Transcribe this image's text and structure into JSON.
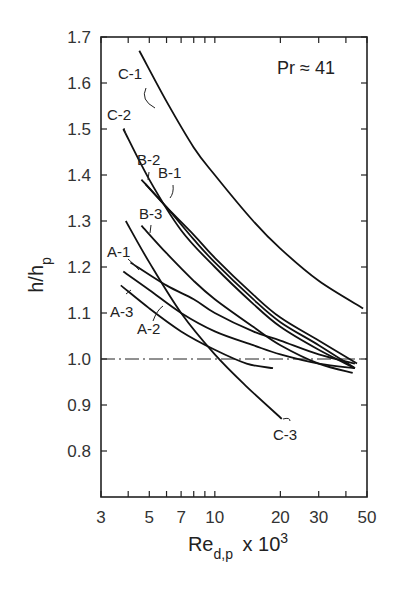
{
  "chart_data": {
    "type": "line",
    "title": "",
    "annotation": "Pr ≈ 41",
    "xlabel": "Re_d,p x 10^3",
    "ylabel": "h/h_p",
    "xscale": "log",
    "xlim": [
      3,
      50
    ],
    "ylim": [
      0.7,
      1.7
    ],
    "xticks": [
      3,
      5,
      7,
      10,
      20,
      30,
      50
    ],
    "xminor": [
      4,
      6,
      8,
      9,
      40
    ],
    "yticks": [
      0.8,
      0.9,
      1.0,
      1.1,
      1.2,
      1.3,
      1.4,
      1.5,
      1.6,
      1.7
    ],
    "reference_line": {
      "y": 1.0,
      "style": "dash-dot"
    },
    "grid": false,
    "series": [
      {
        "name": "C-1",
        "x": [
          4.5,
          6,
          8,
          10,
          15,
          20,
          30,
          48
        ],
        "y": [
          1.67,
          1.56,
          1.46,
          1.4,
          1.3,
          1.24,
          1.17,
          1.11
        ]
      },
      {
        "name": "C-2",
        "x": [
          3.8,
          5,
          7,
          10,
          15,
          20,
          30,
          44
        ],
        "y": [
          1.5,
          1.39,
          1.28,
          1.2,
          1.12,
          1.07,
          1.02,
          0.98
        ]
      },
      {
        "name": "B-2",
        "x": [
          4.6,
          6,
          8,
          10,
          15,
          20,
          30,
          44
        ],
        "y": [
          1.39,
          1.33,
          1.26,
          1.21,
          1.13,
          1.08,
          1.03,
          0.98
        ]
      },
      {
        "name": "B-1",
        "x": [
          4.8,
          6,
          8,
          10,
          15,
          20,
          30,
          45
        ],
        "y": [
          1.38,
          1.33,
          1.27,
          1.22,
          1.14,
          1.09,
          1.04,
          0.99
        ]
      },
      {
        "name": "B-3",
        "x": [
          4.6,
          6,
          8,
          10,
          15,
          20,
          30,
          43
        ],
        "y": [
          1.29,
          1.23,
          1.17,
          1.13,
          1.07,
          1.03,
          0.99,
          0.97
        ]
      },
      {
        "name": "C-3",
        "x": [
          3.9,
          5,
          7,
          10,
          14,
          20.3
        ],
        "y": [
          1.3,
          1.21,
          1.1,
          1.01,
          0.94,
          0.87
        ]
      },
      {
        "name": "A-1",
        "x": [
          4.1,
          6,
          8,
          10,
          15,
          20,
          30,
          44
        ],
        "y": [
          1.21,
          1.16,
          1.13,
          1.1,
          1.06,
          1.04,
          1.01,
          0.99
        ]
      },
      {
        "name": "A-3",
        "x": [
          3.8,
          5,
          7,
          10,
          15,
          20,
          30,
          44
        ],
        "y": [
          1.19,
          1.15,
          1.1,
          1.06,
          1.03,
          1.01,
          0.99,
          0.98
        ]
      },
      {
        "name": "A-2",
        "x": [
          3.7,
          5,
          7,
          10,
          14,
          18.5
        ],
        "y": [
          1.16,
          1.11,
          1.06,
          1.02,
          0.99,
          0.98
        ]
      }
    ],
    "labels": [
      {
        "name": "C-1",
        "x": 118,
        "y": 79,
        "leader": "M146,88 Q140,100 155,108"
      },
      {
        "name": "C-2",
        "x": 107,
        "y": 120,
        "leader": "M124,128 L126,135"
      },
      {
        "name": "B-2",
        "x": 137,
        "y": 165,
        "leader": "M149,172 L148,180"
      },
      {
        "name": "B-1",
        "x": 158,
        "y": 178,
        "leader": "M173,185 Q174,193 170,198"
      },
      {
        "name": "B-3",
        "x": 139,
        "y": 219,
        "leader": "M151,225 L150,233"
      },
      {
        "name": "A-1",
        "x": 107,
        "y": 257,
        "leader": "M128,259 Q135,265 139,270"
      },
      {
        "name": "A-3",
        "x": 110,
        "y": 317,
        "leader": "M126,294 L131,290"
      },
      {
        "name": "A-2",
        "x": 137,
        "y": 334,
        "leader": "M153,321 Q157,310 163,306"
      },
      {
        "name": "C-3",
        "x": 273,
        "y": 440,
        "leader": "M283,419 Q290,417 290,421"
      }
    ]
  }
}
